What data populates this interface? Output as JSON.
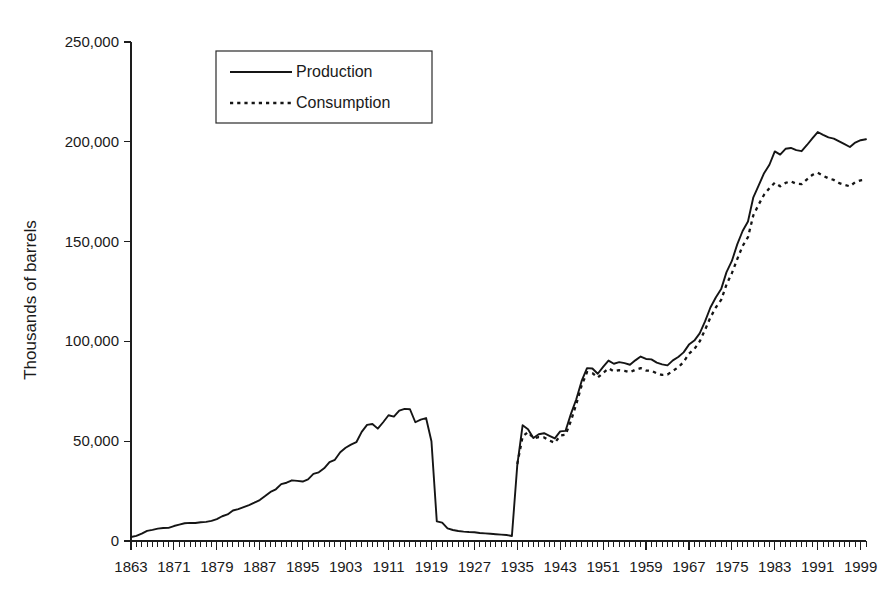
{
  "chart_data": {
    "type": "line",
    "title": "",
    "xlabel": "",
    "ylabel": "Thousands of barrels",
    "xlim": [
      1863,
      2000
    ],
    "ylim": [
      0,
      250000
    ],
    "grid": false,
    "legend_position": "top-left-inset",
    "y_ticks": [
      0,
      50000,
      100000,
      150000,
      200000,
      250000
    ],
    "y_tick_labels": [
      "0",
      "50,000",
      "100,000",
      "150,000",
      "200,000",
      "250,000"
    ],
    "x_ticks": [
      1863,
      1871,
      1879,
      1887,
      1895,
      1903,
      1911,
      1919,
      1927,
      1935,
      1943,
      1951,
      1959,
      1967,
      1975,
      1983,
      1991,
      1999
    ],
    "x_tick_labels": [
      "1863",
      "1871",
      "1879",
      "1887",
      "1895",
      "1903",
      "1911",
      "1919",
      "1927",
      "1935",
      "1943",
      "1951",
      "1959",
      "1967",
      "1975",
      "1983",
      "1991",
      "1999"
    ],
    "x_minor_tick_interval": 1,
    "series": [
      {
        "name": "Production",
        "style": "solid",
        "color": "#151515",
        "x_start": 1863,
        "values": [
          2000,
          2600,
          3700,
          5100,
          5600,
          6200,
          6500,
          6600,
          7500,
          8200,
          8900,
          9100,
          9000,
          9400,
          9600,
          10100,
          11000,
          12400,
          13300,
          15300,
          16000,
          17000,
          18000,
          19200,
          20500,
          22500,
          24600,
          25900,
          28500,
          29200,
          30400,
          30100,
          29800,
          30900,
          33600,
          34400,
          36400,
          39500,
          40700,
          44500,
          46700,
          48300,
          49500,
          54700,
          58200,
          58600,
          56300,
          59500,
          63000,
          62300,
          65300,
          66200,
          66000,
          59500,
          60800,
          61600,
          50000,
          9800,
          9200,
          6300,
          5500,
          5000,
          4700,
          4500,
          4400,
          4000,
          3800,
          3600,
          3400,
          3200,
          3000,
          2500,
          38000,
          58000,
          56000,
          51600,
          53500,
          54000,
          52700,
          51400,
          54900,
          55200,
          63700,
          71000,
          80200,
          86600,
          86400,
          83800,
          87200,
          90400,
          88800,
          89600,
          89100,
          88300,
          90500,
          92400,
          91200,
          91000,
          89400,
          88500,
          88000,
          90500,
          92200,
          94500,
          98400,
          100400,
          104000,
          110000,
          117000,
          122000,
          126200,
          134700,
          140300,
          148600,
          155300,
          160100,
          172200,
          178200,
          184300,
          188500,
          195200,
          193600,
          196500,
          196900,
          195800,
          195300,
          198400,
          201700,
          204900,
          203500,
          202200,
          201600,
          200200,
          198800,
          197400,
          199600,
          200800,
          201300
        ]
      },
      {
        "name": "Consumption",
        "style": "dotted",
        "color": "#151515",
        "x_start": 1935,
        "values": [
          38600,
          52400,
          54600,
          51500,
          52000,
          51900,
          50300,
          49200,
          52800,
          53200,
          60200,
          68600,
          78000,
          84600,
          84100,
          81900,
          84200,
          86500,
          85000,
          85600,
          85200,
          84500,
          85800,
          86600,
          85400,
          85300,
          84000,
          83200,
          83400,
          85200,
          87000,
          89700,
          93800,
          96200,
          100000,
          105800,
          112000,
          117000,
          120800,
          128500,
          134200,
          141200,
          147800,
          152200,
          163200,
          168600,
          173500,
          176800,
          179500,
          177700,
          179400,
          180200,
          179000,
          178800,
          181200,
          183400,
          184500,
          183000,
          181700,
          180900,
          179300,
          178400,
          177700,
          179800,
          180700,
          181000
        ]
      }
    ]
  },
  "legend": {
    "entries": [
      {
        "label": "Production",
        "style": "solid"
      },
      {
        "label": "Consumption",
        "style": "dotted"
      }
    ]
  },
  "axes": {
    "y_title": "Thousands of barrels"
  }
}
